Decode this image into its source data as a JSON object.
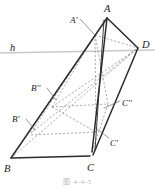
{
  "figure": {
    "caption": "图 4-4-5",
    "plane_line_label": "h",
    "stroke_colors": {
      "solid_edge": "#2b2b2b",
      "hidden_edge": "#8a8a8a",
      "plane_line": "#c8c8c8",
      "leader_line": "#6f6f6f",
      "label_text": "#1a1a1a",
      "caption_text": "#b9b9b9",
      "background": "#ffffff"
    },
    "vertices": [
      {
        "name": "A",
        "label": "A",
        "x": 107,
        "y": 18,
        "label_x": 104,
        "label_y": 4,
        "size": "lbl-lg"
      },
      {
        "name": "D",
        "label": "D",
        "x": 138,
        "y": 48,
        "label_x": 142,
        "label_y": 40,
        "size": "lbl-lg"
      },
      {
        "name": "B",
        "label": "B",
        "x": 11,
        "y": 158,
        "label_x": 4,
        "label_y": 164,
        "size": "lbl-lg"
      },
      {
        "name": "C",
        "label": "C",
        "x": 90,
        "y": 156,
        "label_x": 87,
        "label_y": 163,
        "size": "lbl-lg"
      }
    ],
    "marked_points": [
      {
        "name": "A-prime",
        "label": "A'",
        "px": 95,
        "py": 35,
        "label_x": 70,
        "label_y": 16,
        "size": "lbl-md"
      },
      {
        "name": "B-double-prime",
        "label": "B''",
        "px": 52,
        "py": 107,
        "label_x": 31,
        "label_y": 84,
        "size": "lbl-md"
      },
      {
        "name": "C-double-prime",
        "label": "C''",
        "px": 108,
        "py": 108,
        "label_x": 122,
        "label_y": 99,
        "size": "lbl-md"
      },
      {
        "name": "B-prime",
        "label": "B'",
        "px": 31,
        "py": 133,
        "label_x": 12,
        "label_y": 115,
        "size": "lbl-md"
      },
      {
        "name": "C-prime",
        "label": "C'",
        "px": 97,
        "py": 132,
        "label_x": 110,
        "label_y": 139,
        "size": "lbl-md"
      }
    ],
    "plane_line": {
      "x1": 0,
      "y1": 53,
      "x2": 155,
      "y2": 50,
      "label_x": 10,
      "label_y": 43
    },
    "solid_edges": [
      {
        "name": "edge-B-to-C",
        "x1": 11,
        "y1": 158,
        "x2": 90,
        "y2": 156
      },
      {
        "name": "edge-B-to-A",
        "x1": 11,
        "y1": 158,
        "x2": 107,
        "y2": 18
      },
      {
        "name": "edge-A-to-D",
        "x1": 107,
        "y1": 18,
        "x2": 138,
        "y2": 48
      },
      {
        "name": "edge-D-to-C",
        "x1": 138,
        "y1": 48,
        "x2": 93,
        "y2": 155
      },
      {
        "name": "edge-A-to-C",
        "x1": 107,
        "y1": 18,
        "x2": 92,
        "y2": 152
      },
      {
        "name": "edge-A-sliver",
        "x1": 104,
        "y1": 20,
        "x2": 95,
        "y2": 150
      }
    ],
    "hidden_edges": [
      {
        "name": "hidden-B-to-D",
        "x1": 11,
        "y1": 158,
        "x2": 138,
        "y2": 48
      },
      {
        "name": "hidden-Aprime-to-D",
        "x1": 95,
        "y1": 35,
        "x2": 138,
        "y2": 48
      },
      {
        "name": "hidden-Aprime-to-B",
        "x1": 95,
        "y1": 35,
        "x2": 11,
        "y2": 158
      },
      {
        "name": "hidden-Bpp-to-D",
        "x1": 52,
        "y1": 107,
        "x2": 138,
        "y2": 48
      },
      {
        "name": "hidden-Bp-to-D",
        "x1": 31,
        "y1": 133,
        "x2": 138,
        "y2": 48
      },
      {
        "name": "hidden-Bpp-to-Cpp",
        "x1": 52,
        "y1": 107,
        "x2": 108,
        "y2": 104
      },
      {
        "name": "hidden-Bp-to-Cp",
        "x1": 31,
        "y1": 135,
        "x2": 96,
        "y2": 132
      },
      {
        "name": "hidden-Aprime-vert",
        "x1": 95,
        "y1": 35,
        "x2": 96,
        "y2": 132
      },
      {
        "name": "hidden-Aprime-to-Cpp",
        "x1": 95,
        "y1": 35,
        "x2": 108,
        "y2": 104
      },
      {
        "name": "hidden-Bpp-to-Aprime",
        "x1": 52,
        "y1": 107,
        "x2": 95,
        "y2": 35
      },
      {
        "name": "hidden-Bp-to-Aprime",
        "x1": 31,
        "y1": 133,
        "x2": 95,
        "y2": 35
      },
      {
        "name": "hidden-Cpp-to-C",
        "x1": 108,
        "y1": 104,
        "x2": 92,
        "y2": 152
      },
      {
        "name": "hidden-Bpp-to-Cp",
        "x1": 52,
        "y1": 107,
        "x2": 96,
        "y2": 132
      }
    ],
    "leader_lines": [
      {
        "name": "leader-A-prime",
        "x1": 80,
        "y1": 19,
        "x2": 95,
        "y2": 35
      },
      {
        "name": "leader-B-double-prime",
        "x1": 47,
        "y1": 88,
        "x2": 56,
        "y2": 100
      },
      {
        "name": "leader-C-double-prime",
        "x1": 120,
        "y1": 101,
        "x2": 104,
        "y2": 108
      },
      {
        "name": "leader-B-prime",
        "x1": 26,
        "y1": 119,
        "x2": 35,
        "y2": 130
      },
      {
        "name": "leader-C-prime",
        "x1": 109,
        "y1": 138,
        "x2": 97,
        "y2": 129
      }
    ]
  }
}
